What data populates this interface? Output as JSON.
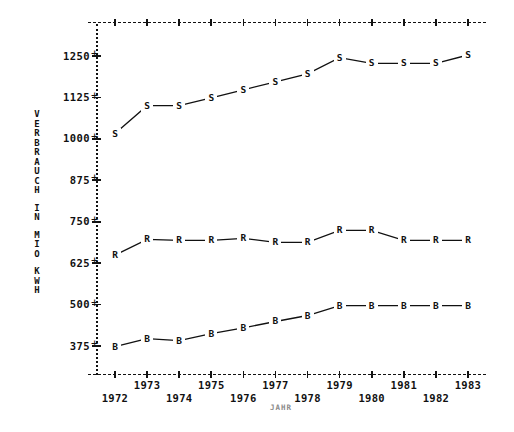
{
  "chart_data": {
    "type": "line",
    "title": "",
    "xlabel": "JAHR",
    "ylabel": "VERBRAUCH IN MIO KWH",
    "grid": false,
    "legend": "none",
    "marker_labels": true,
    "x": [
      1972,
      1973,
      1974,
      1975,
      1976,
      1977,
      1978,
      1979,
      1980,
      1981,
      1982,
      1983
    ],
    "categories": [
      "1972",
      "1973",
      "1974",
      "1975",
      "1976",
      "1977",
      "1978",
      "1979",
      "1980",
      "1981",
      "1982",
      "1983"
    ],
    "xlim": [
      1971.5,
      1983.6
    ],
    "ylim": [
      290,
      1320
    ],
    "yticks": [
      375,
      500,
      625,
      750,
      875,
      1000,
      1125,
      1250
    ],
    "ytick_labels": [
      "375",
      "500",
      "625",
      "750",
      "875",
      "1000",
      "1125",
      "1250"
    ],
    "series": [
      {
        "name": "S",
        "marker": "S",
        "values": [
          1016,
          1100,
          1100,
          1124,
          1148,
          1172,
          1196,
          1245,
          1228,
          1228,
          1228,
          1253
        ]
      },
      {
        "name": "R",
        "marker": "R",
        "values": [
          649,
          697,
          694,
          694,
          700,
          688,
          688,
          724,
          724,
          694,
          694,
          694
        ]
      },
      {
        "name": "B",
        "marker": "B",
        "values": [
          373,
          397,
          391,
          412,
          430,
          449,
          467,
          497,
          497,
          497,
          497,
          497
        ]
      }
    ]
  },
  "axis": {
    "ylabel_chars": [
      "V",
      "E",
      "R",
      "B",
      "R",
      "A",
      "U",
      "C",
      "H",
      "I",
      "N",
      "M",
      "I",
      "O",
      "K",
      "W",
      "H"
    ],
    "xlabel_text": "JAHR"
  },
  "colors": {
    "ink": "#111111",
    "background": "#ffffff",
    "xlabel_muted": "#8a8a8a"
  }
}
